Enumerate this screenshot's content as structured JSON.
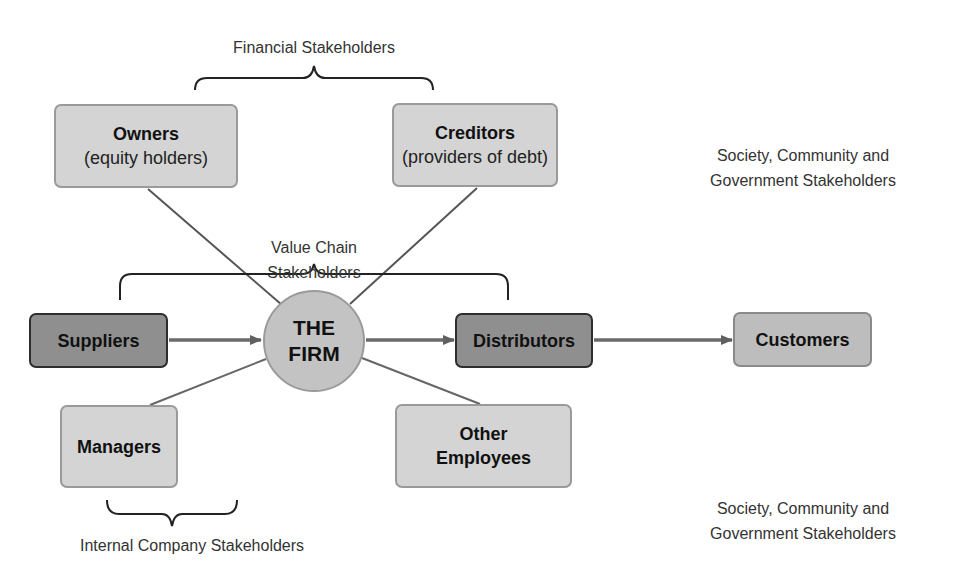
{
  "diagram": {
    "groups": {
      "financial": {
        "label": "Financial Stakeholders"
      },
      "value_chain": {
        "label_line1": "Value Chain",
        "label_line2": "Stakeholders"
      },
      "internal": {
        "label": "Internal Company Stakeholders"
      },
      "society_top": {
        "label_line1": "Society, Community and",
        "label_line2": "Government Stakeholders"
      },
      "society_bottom": {
        "label_line1": "Society, Community and",
        "label_line2": "Government Stakeholders"
      }
    },
    "center": {
      "line1": "THE",
      "line2": "FIRM"
    },
    "nodes": {
      "owners": {
        "title": "Owners",
        "subtitle": "(equity holders)"
      },
      "creditors": {
        "title": "Creditors",
        "subtitle": "(providers of debt)"
      },
      "suppliers": {
        "title": "Suppliers"
      },
      "distributors": {
        "title": "Distributors"
      },
      "customers": {
        "title": "Customers"
      },
      "managers": {
        "title": "Managers"
      },
      "other_employees": {
        "title_line1": "Other",
        "title_line2": "Employees"
      }
    },
    "edges": [
      {
        "from": "suppliers",
        "to": "the_firm",
        "type": "arrow"
      },
      {
        "from": "the_firm",
        "to": "distributors",
        "type": "arrow"
      },
      {
        "from": "distributors",
        "to": "customers",
        "type": "arrow"
      },
      {
        "from": "owners",
        "to": "the_firm",
        "type": "line"
      },
      {
        "from": "creditors",
        "to": "the_firm",
        "type": "line"
      },
      {
        "from": "managers",
        "to": "the_firm",
        "type": "line"
      },
      {
        "from": "other_employees",
        "to": "the_firm",
        "type": "line"
      }
    ],
    "colors": {
      "light_box": "#d4d4d4",
      "dark_box": "#8f8f8f",
      "customers_box": "#bdbdbd",
      "firm_circle": "#c3c3c3",
      "line": "#5a5a5a"
    }
  }
}
